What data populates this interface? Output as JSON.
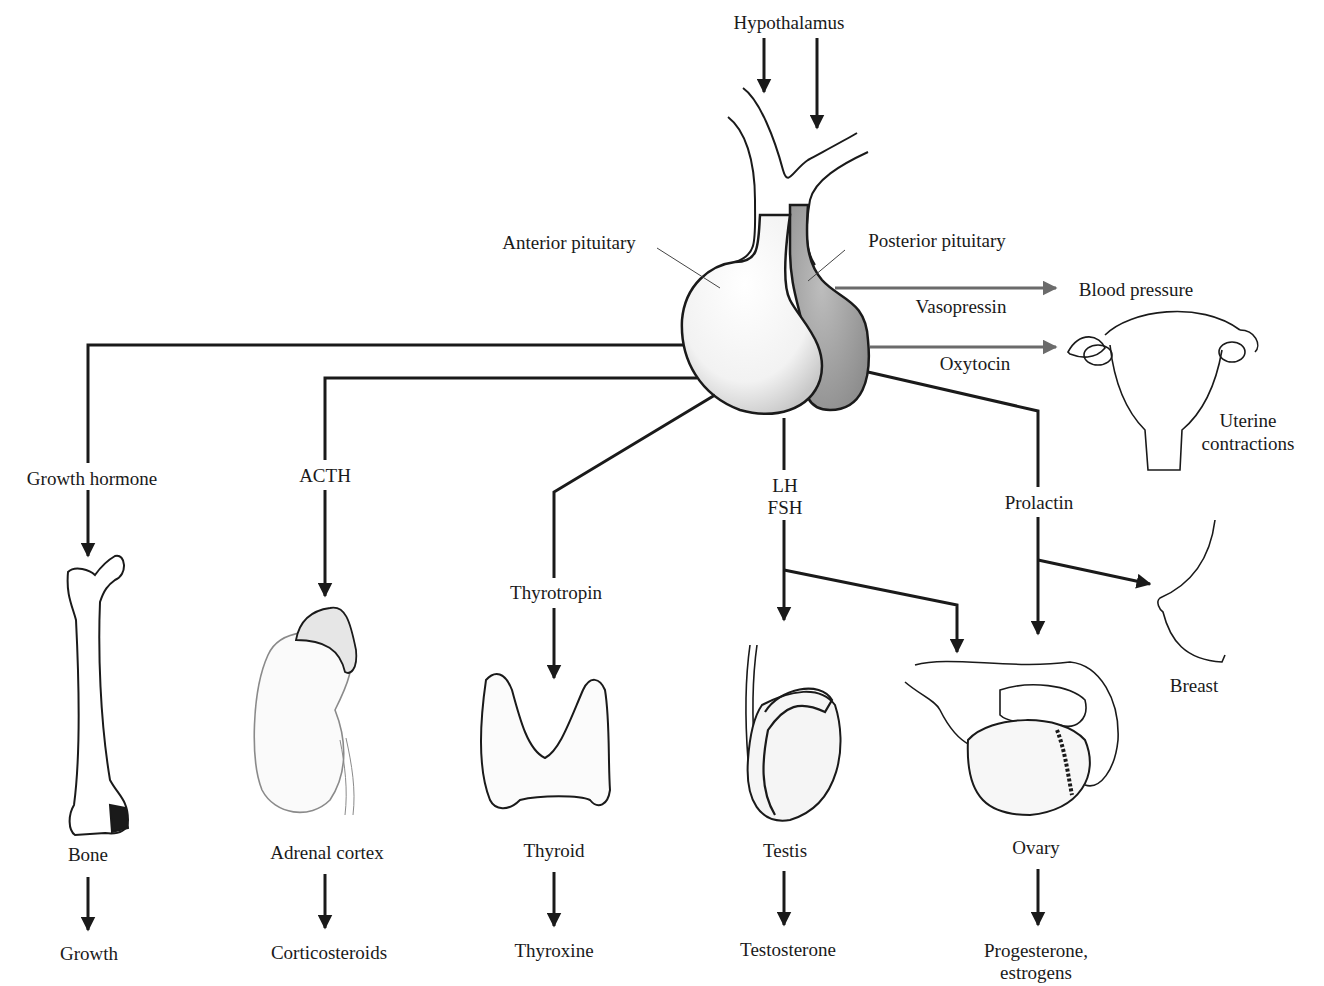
{
  "diagram": {
    "type": "anatomical-flow",
    "accent_gray": "#6b6b6b",
    "line_color": "#1a1a1a",
    "posterior_fill": "#a9a9a9"
  },
  "top": {
    "hypothalamus": "Hypothalamus",
    "anterior_pituitary": "Anterior pituitary",
    "posterior_pituitary": "Posterior pituitary"
  },
  "posterior_outputs": [
    {
      "hormone": "Vasopressin",
      "target": "Blood pressure"
    },
    {
      "hormone": "Oxytocin",
      "target_line1": "Uterine",
      "target_line2": "contractions"
    }
  ],
  "anterior_outputs": [
    {
      "hormone": "Growth hormone",
      "organ": "Bone",
      "product": "Growth"
    },
    {
      "hormone": "ACTH",
      "organ": "Adrenal cortex",
      "product": "Corticosteroids"
    },
    {
      "hormone": "Thyrotropin",
      "organ": "Thyroid",
      "product": "Thyroxine"
    },
    {
      "hormone_line1": "LH",
      "hormone_line2": "FSH",
      "organ": "Testis",
      "product": "Testosterone"
    },
    {
      "organ": "Ovary",
      "product_line1": "Progesterone,",
      "product_line2": "estrogens"
    },
    {
      "hormone": "Prolactin",
      "organ": "Breast"
    }
  ]
}
